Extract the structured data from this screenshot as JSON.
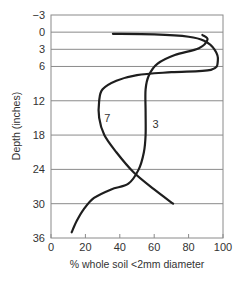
{
  "chart_data": {
    "type": "line",
    "title": "",
    "xlabel": "% whole soil <2mm diameter",
    "ylabel": "Depth (inches)",
    "xlim": [
      0,
      100
    ],
    "ylim": [
      -3,
      36
    ],
    "y_inverted": true,
    "x_ticks": [
      "0",
      "20",
      "40",
      "60",
      "80",
      "100"
    ],
    "y_ticks": [
      "-3",
      "0",
      "3",
      "6",
      "12",
      "18",
      "24",
      "30",
      "36"
    ],
    "grid": "horizontal",
    "legend": "inline labels",
    "series": [
      {
        "name": "7",
        "label_position": [
          31,
          15
        ],
        "points": [
          [
            36,
            0.3
          ],
          [
            60,
            0.4
          ],
          [
            80,
            0.8
          ],
          [
            89,
            1.5
          ],
          [
            95,
            3
          ],
          [
            97,
            5
          ],
          [
            93,
            6.6
          ],
          [
            70,
            7
          ],
          [
            50,
            7.5
          ],
          [
            38,
            8.5
          ],
          [
            30,
            10
          ],
          [
            28,
            12
          ],
          [
            28,
            15
          ],
          [
            31,
            18
          ],
          [
            38,
            21
          ],
          [
            48,
            24.5
          ],
          [
            60,
            27.5
          ],
          [
            71,
            30
          ]
        ]
      },
      {
        "name": "3",
        "label_position": [
          59,
          16
        ],
        "points": [
          [
            88,
            0.5
          ],
          [
            91,
            1.3
          ],
          [
            86,
            2.8
          ],
          [
            72,
            4
          ],
          [
            62,
            5.5
          ],
          [
            57,
            7.5
          ],
          [
            55,
            10
          ],
          [
            55,
            14
          ],
          [
            55,
            18
          ],
          [
            54,
            21
          ],
          [
            51,
            24
          ],
          [
            45,
            26.5
          ],
          [
            35,
            27.5
          ],
          [
            25,
            29
          ],
          [
            19,
            31
          ],
          [
            15,
            33
          ],
          [
            12,
            35
          ]
        ]
      }
    ]
  }
}
